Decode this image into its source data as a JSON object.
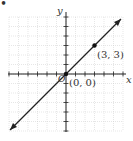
{
  "chart_data": {
    "type": "line",
    "title": "",
    "xlabel": "x",
    "ylabel": "y",
    "xlim": [
      -6,
      6
    ],
    "ylim": [
      -6,
      6
    ],
    "grid": true,
    "series": [
      {
        "name": "y = x",
        "x": [
          -6,
          6
        ],
        "y": [
          -6,
          6
        ]
      }
    ],
    "points": [
      {
        "x": 0,
        "y": 0,
        "label": "(0, 0)"
      },
      {
        "x": 3,
        "y": 3,
        "label": "(3, 3)"
      }
    ],
    "origin_label": "O"
  },
  "labels": {
    "x_axis": "x",
    "y_axis": "y",
    "p1": "(3, 3)",
    "p0": "(0, 0)",
    "origin": "O",
    "bullet": "•"
  }
}
